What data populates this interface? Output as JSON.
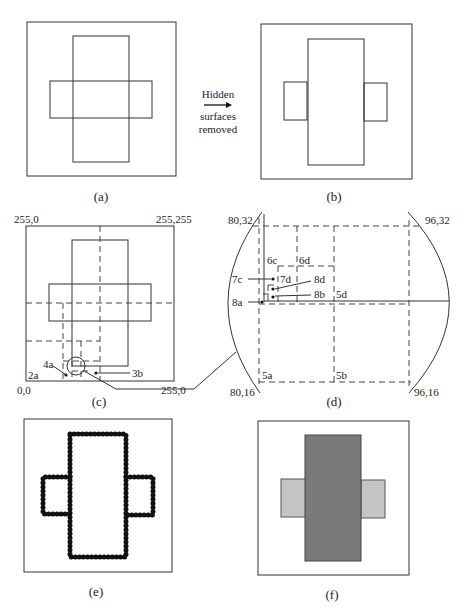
{
  "figure": {
    "panels": [
      {
        "id": "a",
        "caption": "(a)",
        "description": "Overlapping rectangles inside viewport (wireframe)"
      },
      {
        "id": "b",
        "caption": "(b)",
        "description": "Hidden surfaces removed"
      },
      {
        "id": "c",
        "caption": "(c)",
        "description": "Quadtree subdivision of screen"
      },
      {
        "id": "d",
        "caption": "(d)",
        "description": "Magnified subdivision detail"
      },
      {
        "id": "e",
        "caption": "(e)",
        "description": "Pixel outline result"
      },
      {
        "id": "f",
        "caption": "(f)",
        "description": "Shaded result"
      }
    ],
    "arrow": {
      "top_label": "Hidden",
      "bottom_label_1": "surfaces",
      "bottom_label_2": "removed"
    },
    "panel_c": {
      "corner_top_left": "255,0",
      "corner_top_right": "255,255",
      "corner_bottom_left": "0,0",
      "corner_bottom_right": "255,0",
      "labels": {
        "l2a": "2a",
        "l4a": "4a",
        "l3b": "3b"
      }
    },
    "panel_d": {
      "corner_top_left": "80,32",
      "corner_top_right": "96,32",
      "corner_bottom_left": "80,16",
      "corner_bottom_right": "96,16",
      "labels": {
        "l6c": "6c",
        "l6d": "6d",
        "l7c": "7c",
        "l7d": "7d",
        "l8d": "8d",
        "l8b": "8b",
        "l8a": "8a",
        "l5d": "5d",
        "l5a": "5a",
        "l5b": "5b"
      }
    },
    "colors": {
      "front_rect": "#7a7a7a",
      "back_rect": "#c4c4c4",
      "line": "#333333"
    }
  }
}
